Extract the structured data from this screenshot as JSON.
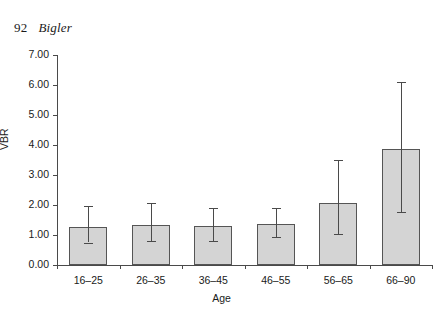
{
  "page": {
    "folio": "92",
    "author": "Bigler"
  },
  "chart_data": {
    "type": "bar",
    "title": "",
    "subtitle": "",
    "xlabel": "Age",
    "ylabel": "VBR",
    "categories": [
      "16–25",
      "26–35",
      "36–45",
      "46–55",
      "56–65",
      "66–90"
    ],
    "values": [
      1.27,
      1.35,
      1.3,
      1.37,
      2.07,
      3.88
    ],
    "error_low": [
      0.75,
      0.8,
      0.8,
      0.93,
      1.05,
      1.77
    ],
    "error_high": [
      1.97,
      2.07,
      1.9,
      1.9,
      3.5,
      6.1
    ],
    "ylim": [
      0.0,
      7.0
    ],
    "ytick_labels": [
      "0.00",
      "1.00",
      "2.00",
      "3.00",
      "4.00",
      "5.00",
      "6.00",
      "7.00"
    ],
    "ytick_values": [
      0,
      1,
      2,
      3,
      4,
      5,
      6,
      7
    ],
    "grid": false,
    "legend": null,
    "bar_fill_color": "#d4d4d4",
    "bar_edge_color": "#555555",
    "axis_color": "#4a4a4a",
    "error_bar_style": "asymmetric-range-with-caps"
  }
}
